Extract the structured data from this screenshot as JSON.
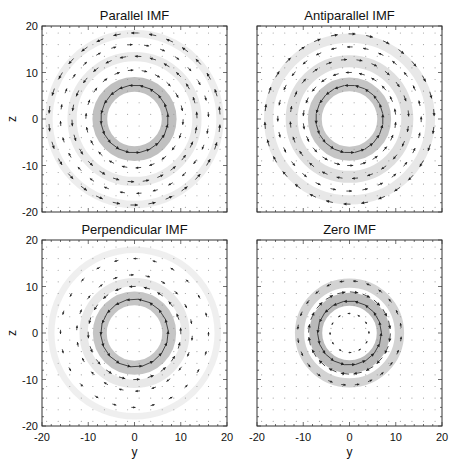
{
  "figure": {
    "xlabel": "y",
    "ylabel": "z",
    "axis_range": [
      -20,
      20
    ],
    "ticks": [
      "-20",
      "-10",
      "0",
      "10",
      "20"
    ],
    "panels": [
      {
        "id": "parallel",
        "title": "Parallel IMF",
        "box": [
          42,
          26,
          185,
          186
        ],
        "show_y_ticks": true,
        "show_x_ticks": false,
        "rings": [
          {
            "r": 7.5,
            "w": 3.2,
            "alpha": 0.55
          },
          {
            "r": 13.5,
            "w": 2.0,
            "alpha": 0.18
          },
          {
            "r": 18.5,
            "w": 1.6,
            "alpha": 0.16
          }
        ],
        "arrow_rings": [
          {
            "r": 7.2,
            "n": 20,
            "len": 2.4,
            "dir": 1
          },
          {
            "r": 10.5,
            "n": 22,
            "len": 1.2,
            "dir": -1
          },
          {
            "r": 13.5,
            "n": 26,
            "len": 1.4,
            "dir": 1
          },
          {
            "r": 16,
            "n": 28,
            "len": 1.1,
            "dir": -1
          },
          {
            "r": 18.5,
            "n": 30,
            "len": 1.6,
            "dir": 1
          }
        ]
      },
      {
        "id": "antiparallel",
        "title": "Antiparallel IMF",
        "box": [
          257,
          26,
          185,
          186
        ],
        "show_y_ticks": false,
        "show_x_ticks": false,
        "rings": [
          {
            "r": 7.5,
            "w": 3.0,
            "alpha": 0.5
          },
          {
            "r": 12.5,
            "w": 2.6,
            "alpha": 0.28
          },
          {
            "r": 17.5,
            "w": 2.0,
            "alpha": 0.2
          }
        ],
        "arrow_rings": [
          {
            "r": 7.2,
            "n": 20,
            "len": 2.2,
            "dir": 1
          },
          {
            "r": 10,
            "n": 22,
            "len": 1.3,
            "dir": 1
          },
          {
            "r": 12.8,
            "n": 24,
            "len": 1.3,
            "dir": -1
          },
          {
            "r": 15.5,
            "n": 28,
            "len": 1.2,
            "dir": 1
          },
          {
            "r": 18.3,
            "n": 30,
            "len": 1.5,
            "dir": -1
          }
        ]
      },
      {
        "id": "perpendicular",
        "title": "Perpendicular IMF",
        "box": [
          42,
          240,
          185,
          186
        ],
        "show_y_ticks": true,
        "show_x_ticks": true,
        "rings": [
          {
            "r": 7.5,
            "w": 3.0,
            "alpha": 0.5
          },
          {
            "r": 11,
            "w": 1.8,
            "alpha": 0.2
          },
          {
            "r": 18,
            "w": 1.4,
            "alpha": 0.14
          }
        ],
        "arrow_rings": [
          {
            "r": 7.2,
            "n": 18,
            "len": 2.6,
            "dir": 1
          },
          {
            "r": 10,
            "n": 20,
            "len": 1.4,
            "dir": 1
          },
          {
            "r": 12.5,
            "n": 22,
            "len": 1.0,
            "dir": -1
          },
          {
            "r": 16,
            "n": 24,
            "len": 0.9,
            "dir": 1
          }
        ]
      },
      {
        "id": "zero",
        "title": "Zero IMF",
        "box": [
          257,
          240,
          185,
          186
        ],
        "show_y_ticks": false,
        "show_x_ticks": true,
        "rings": [
          {
            "r": 7.3,
            "w": 2.8,
            "alpha": 0.6
          },
          {
            "r": 10.8,
            "w": 2.0,
            "alpha": 0.38
          }
        ],
        "arrow_rings": [
          {
            "r": 6.8,
            "n": 18,
            "len": 2.4,
            "dir": 1
          },
          {
            "r": 8.8,
            "n": 20,
            "len": 1.8,
            "dir": -1
          },
          {
            "r": 11.2,
            "n": 24,
            "len": 1.0,
            "dir": 1
          },
          {
            "r": 4.2,
            "n": 12,
            "len": 0.6,
            "dir": 1
          }
        ]
      }
    ]
  },
  "chart_data": {
    "type": "vector_field",
    "title": "",
    "xlabel": "y",
    "ylabel": "z",
    "xlim": [
      -20,
      20
    ],
    "ylim": [
      -20,
      20
    ],
    "xticks": [
      -20,
      -10,
      0,
      10,
      20
    ],
    "yticks": [
      -20,
      -10,
      0,
      10,
      20
    ],
    "grid": false,
    "layout": "2x2 panels",
    "panels": [
      {
        "title": "Parallel IMF",
        "description": "Concentric circulating flow with strong inner ring near r~7-8 and outer rings near r~13 and r~18; shading marks high-magnitude annuli"
      },
      {
        "title": "Antiparallel IMF",
        "description": "Strong inner ring near r~7-8 with broader multi-ring circulation out to r~18"
      },
      {
        "title": "Perpendicular IMF",
        "description": "Asymmetric flow, strong ring near r~7-8, outer faint ring near r~18, arrows predominantly horizontal outside"
      },
      {
        "title": "Zero IMF",
        "description": "Compact double ring near r~7 and r~11, negligible field outside r~12"
      }
    ]
  }
}
